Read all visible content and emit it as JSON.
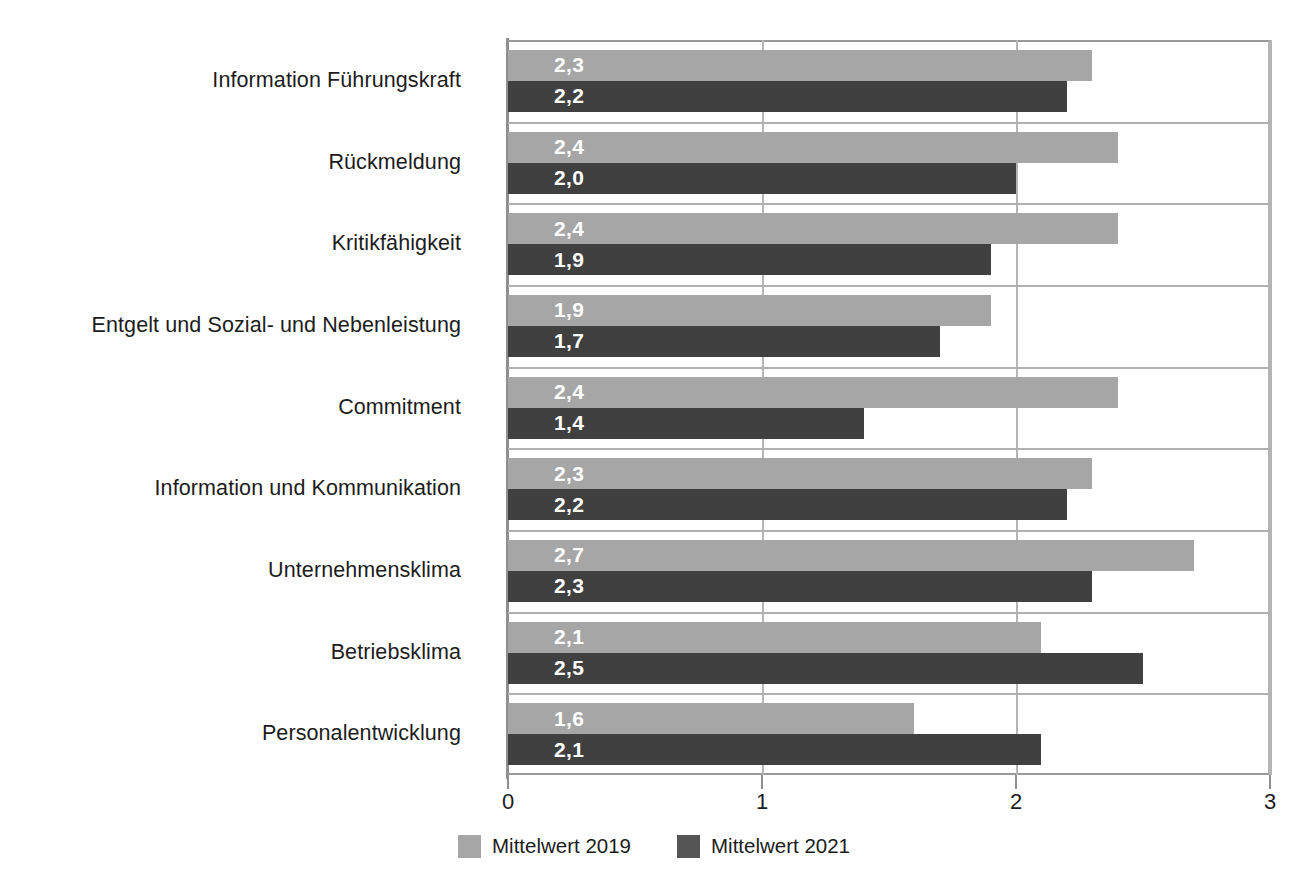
{
  "chart_data": {
    "type": "bar",
    "orientation": "horizontal",
    "title": "",
    "xlabel": "",
    "ylabel": "",
    "xlim": [
      0,
      3
    ],
    "xticks": [
      "0",
      "1",
      "2",
      "3"
    ],
    "xtick_values": [
      0,
      1,
      2,
      3
    ],
    "grid": true,
    "grid_axis": "both",
    "legend_position": "bottom",
    "categories": [
      "Information Führungskraft",
      "Rückmeldung",
      "Kritikfähigkeit",
      "Entgelt und Sozial- und Nebenleistung",
      "Commitment",
      "Information und Kommunikation",
      "Unternehmensklima",
      "Betriebsklima",
      "Personalentwicklung"
    ],
    "series": [
      {
        "name": "Mittelwert 2019",
        "color": "#a6a6a6",
        "values": [
          2.3,
          2.4,
          2.4,
          1.9,
          2.4,
          2.3,
          2.7,
          2.1,
          1.6
        ],
        "labels": [
          "2,3",
          "2,4",
          "2,4",
          "1,9",
          "2,4",
          "2,3",
          "2,7",
          "2,1",
          "1,6"
        ]
      },
      {
        "name": "Mittelwert 2021",
        "color": "#404040",
        "values": [
          2.2,
          2.0,
          1.9,
          1.7,
          1.4,
          2.2,
          2.3,
          2.5,
          2.1
        ],
        "labels": [
          "2,2",
          "2,0",
          "1,9",
          "1,7",
          "1,4",
          "2,2",
          "2,3",
          "2,5",
          "2,1"
        ]
      }
    ]
  },
  "legend": {
    "items": [
      {
        "label": "Mittelwert 2019",
        "color": "#a6a6a6"
      },
      {
        "label": "Mittelwert 2021",
        "color": "#555555"
      }
    ]
  },
  "colors": {
    "series_2019": "#a6a6a6",
    "series_2021": "#404040",
    "grid": "#b5b5b5",
    "axis": "#8f8f8f",
    "text": "#1c1c1c",
    "value_label": "#ffffff",
    "background": "#ffffff"
  }
}
